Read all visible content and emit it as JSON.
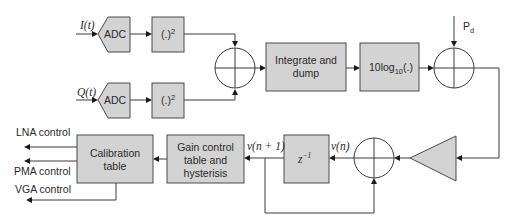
{
  "diagram": {
    "type": "block-diagram",
    "title": "",
    "inputs": {
      "i_signal": "I(t)",
      "q_signal": "Q(t)",
      "desired_power": "P",
      "desired_power_sub": "d"
    },
    "blocks": {
      "adc_i": "ADC",
      "adc_q": "ADC",
      "square_i": "(.)",
      "square_i_sup": "2",
      "square_q": "(.)",
      "square_q_sup": "2",
      "integrate_line1": "Integrate and",
      "integrate_line2": "dump",
      "log_prefix": "10log",
      "log_sub": "10",
      "log_suffix": "(.)",
      "delay": "z",
      "delay_sup": "−1",
      "gain_line1": "Gain control",
      "gain_line2": "table and",
      "gain_line3": "hysterisis",
      "calib_line1": "Calibration",
      "calib_line2": "table"
    },
    "signals": {
      "v_n": "v(n)",
      "v_n1": "v(n + 1)"
    },
    "outputs": {
      "lna": "LNA control",
      "pma": "PMA control",
      "vga": "VGA control"
    },
    "colors": {
      "block_fill": "#d3d3d3",
      "stroke": "#3a3a3a",
      "background": "#ffffff"
    }
  }
}
